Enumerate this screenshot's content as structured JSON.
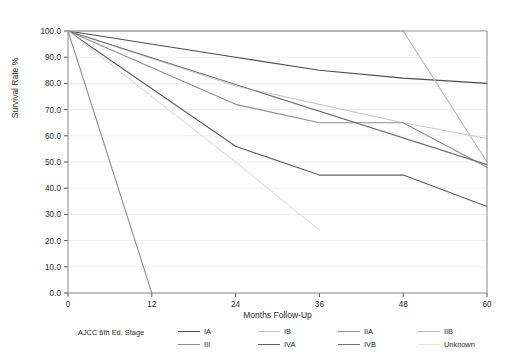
{
  "chart_data": {
    "type": "line",
    "title": "",
    "xlabel": "Months Follow-Up",
    "ylabel": "Survival Rate %",
    "x": [
      0,
      12,
      24,
      36,
      48,
      60
    ],
    "xticks": [
      "0",
      "12",
      "24",
      "36",
      "48",
      "60"
    ],
    "xlim": [
      0,
      60
    ],
    "ylim": [
      0,
      100
    ],
    "yticks": [
      "0.0",
      "10.0",
      "20.0",
      "30.0",
      "40.0",
      "50.0",
      "60.0",
      "70.0",
      "80.0",
      "90.0",
      "100.0"
    ],
    "grid": true,
    "legend_position": "bottom",
    "legend_title": "AJCC 6th Ed. Stage",
    "series": [
      {
        "name": "IA",
        "color": "#4d4d4d",
        "x": [
          0,
          24,
          36,
          48,
          60
        ],
        "values": [
          100.0,
          90.0,
          85.0,
          82.0,
          80.0
        ]
      },
      {
        "name": "IB",
        "color": "#c9c9c9",
        "x": [
          0,
          24,
          36,
          48,
          60
        ],
        "values": [
          100.0,
          79.0,
          72.0,
          65.0,
          59.0
        ]
      },
      {
        "name": "IIA",
        "color": "#8f8f8f",
        "x": [
          0,
          24,
          36,
          48,
          60
        ],
        "values": [
          100.0,
          72.0,
          65.0,
          65.0,
          48.0
        ]
      },
      {
        "name": "IIB",
        "color": "#b8b8b8",
        "x": [
          0,
          48,
          60
        ],
        "values": [
          100.0,
          100.0,
          50.0
        ]
      },
      {
        "name": "III",
        "color": "#8f8f8f",
        "x": [
          0,
          12
        ],
        "values": [
          100.0,
          0.0
        ]
      },
      {
        "name": "IVA",
        "color": "#5e5e5e",
        "x": [
          0,
          24,
          36,
          48,
          60
        ],
        "values": [
          100.0,
          56.0,
          45.0,
          45.0,
          33.0
        ]
      },
      {
        "name": "IVB",
        "color": "#707070",
        "x": [
          0,
          60
        ],
        "values": [
          100.0,
          49.0
        ]
      },
      {
        "name": "Unknown",
        "color": "#e0e0e0",
        "x": [
          0,
          24,
          36
        ],
        "values": [
          100.0,
          50.0,
          24.0
        ]
      }
    ]
  },
  "axes": {
    "ylabel": "Survival Rate %",
    "xlabel": "Months Follow-Up"
  },
  "legend": {
    "title": "AJCC 6th Ed. Stage",
    "items": [
      {
        "label": "IA",
        "color": "#4d4d4d"
      },
      {
        "label": "IB",
        "color": "#c9c9c9"
      },
      {
        "label": "IIA",
        "color": "#8f8f8f"
      },
      {
        "label": "IIB",
        "color": "#b8b8b8"
      },
      {
        "label": "III",
        "color": "#8f8f8f"
      },
      {
        "label": "IVA",
        "color": "#5e5e5e"
      },
      {
        "label": "IVB",
        "color": "#707070"
      },
      {
        "label": "Unknown",
        "color": "#e0e0e0"
      }
    ]
  }
}
